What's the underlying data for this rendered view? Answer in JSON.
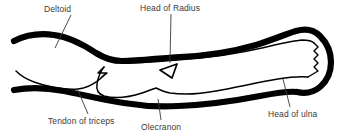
{
  "figure": {
    "background_color": "#ffffff",
    "ink_color": "#000000",
    "text_color": "#3a3a3a",
    "width": 348,
    "height": 139
  },
  "labels": {
    "deltoid": "Deltoid",
    "head_of_radius": "Head of Radius",
    "tendon_of_triceps": "Tendon of triceps",
    "olecranon": "Olecranon",
    "head_of_ulna": "Head of ulna"
  },
  "annotations": {
    "arrow_marker": "arrowhead-pointing-left"
  }
}
